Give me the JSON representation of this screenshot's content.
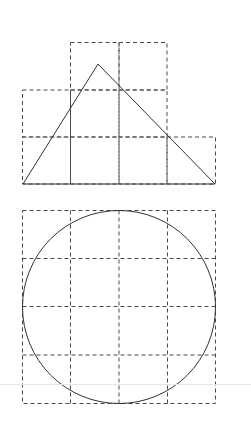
{
  "canvas": {
    "width": 251,
    "height": 428,
    "background": "#ffffff"
  },
  "colors": {
    "grid": "#4a4a4a",
    "shape": "#333333",
    "faint_line": "#e6e6e6"
  },
  "figures": [
    {
      "name": "triangle-on-grid",
      "grid_cell_size": 48,
      "grid_cells": [
        [
          1,
          0
        ],
        [
          2,
          0
        ],
        [
          0,
          1
        ],
        [
          1,
          1
        ],
        [
          2,
          1
        ],
        [
          0,
          2
        ],
        [
          1,
          2
        ],
        [
          2,
          2
        ],
        [
          3,
          2
        ]
      ],
      "grid_origin": [
        22,
        42
      ],
      "triangle": {
        "points": [
          [
            22,
            184
          ],
          [
            98,
            64
          ],
          [
            215,
            184
          ]
        ]
      }
    },
    {
      "name": "circle-on-grid",
      "grid_cell_size": 48.25,
      "grid_cols": 4,
      "grid_rows": 4,
      "grid_origin": [
        22,
        210
      ],
      "circle": {
        "cx": 119,
        "cy": 306.5,
        "r": 96.5
      }
    }
  ],
  "faint_line_y": 384
}
